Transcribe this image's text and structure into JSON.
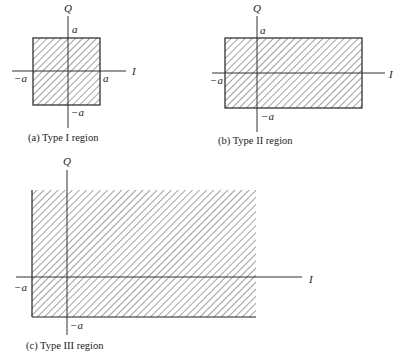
{
  "figure": {
    "panels": [
      {
        "id": "a",
        "caption": "(a) Type I region",
        "axis_labels": {
          "horizontal": "I",
          "vertical": "Q"
        },
        "tick_labels": {
          "top": "a",
          "right": "a",
          "left": "−a",
          "bottom": "−a"
        },
        "region": "square |I|≤a, |Q|≤a (hatched)"
      },
      {
        "id": "b",
        "caption": "(b) Type II region",
        "axis_labels": {
          "horizontal": "I",
          "vertical": "Q"
        },
        "tick_labels": {
          "top": "a",
          "left": "−a",
          "bottom": "−a"
        },
        "region": "strip I≥−a, |Q|≤a (hatched, extends right)"
      },
      {
        "id": "c",
        "caption": "(c) Type III region",
        "axis_labels": {
          "horizontal": "I",
          "vertical": "Q"
        },
        "tick_labels": {
          "left": "−a",
          "bottom": "−a"
        },
        "region": "quadrant I≥−a, Q≥−a (hatched, extends up and right)"
      }
    ]
  }
}
